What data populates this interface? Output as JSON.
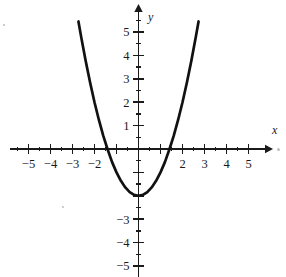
{
  "figure": {
    "kind": "cartesian-graph",
    "background_color": "#ffffff",
    "ink_color": "#1a1a1a",
    "curve_color": "#111111"
  },
  "axes": {
    "x_axis_label": "x",
    "y_axis_label": "y",
    "x_label_style": "italic",
    "y_label_style": "italic",
    "x_tick_labels": [
      "-5",
      "-4",
      "-3",
      "-2",
      "2",
      "3",
      "4",
      "5"
    ],
    "x_tick_values": [
      -5,
      -4,
      -3,
      -2,
      2,
      3,
      4,
      5
    ],
    "x_tick_hidden_values": [
      -1,
      0,
      1
    ],
    "y_tick_labels": [
      "5",
      "4",
      "3",
      "2",
      "1",
      "-3",
      "-4",
      "-5"
    ],
    "y_tick_values": [
      5,
      4,
      3,
      2,
      1,
      -3,
      -4,
      -5
    ],
    "y_tick_hidden_values": [
      -1,
      -2,
      0
    ],
    "x_major_ticks": [
      -5,
      -4,
      -3,
      -2,
      -1,
      1,
      2,
      3,
      4,
      5
    ],
    "x_minor_ticks": [
      -5.5,
      -4.5,
      -3.5,
      -2.5,
      -1.5,
      -0.5,
      0.5,
      1.5,
      2.5,
      3.5,
      4.5
    ],
    "y_major_ticks": [
      5,
      4,
      3,
      2,
      1,
      -1,
      -2,
      -3,
      -4,
      -5
    ],
    "y_minor_ticks": [
      5.5,
      4.5,
      3.5,
      2.5,
      1.5,
      0.5,
      -0.5,
      -1.5,
      -2.5,
      -3.5,
      -4.5
    ],
    "has_x_arrow": true,
    "has_y_arrow": true,
    "grid": false
  },
  "chart_data": {
    "type": "line",
    "title": "",
    "xlabel": "x",
    "ylabel": "y",
    "xlim": [
      -5.8,
      5.8
    ],
    "ylim": [
      -5.6,
      5.9
    ],
    "grid": false,
    "legend": "none",
    "series": [
      {
        "name": "parabola",
        "equation": "y = x^2 - 2",
        "vertex": [
          0,
          -2
        ],
        "x_intercepts": [
          -1.41,
          1.41
        ],
        "y_intercept": -2,
        "x": [
          -2.73,
          -2.6,
          -2.4,
          -2.2,
          -2.0,
          -1.8,
          -1.6,
          -1.41,
          -1.2,
          -1.0,
          -0.8,
          -0.6,
          -0.4,
          -0.2,
          0,
          0.2,
          0.4,
          0.6,
          0.8,
          1.0,
          1.2,
          1.41,
          1.6,
          1.8,
          2.0,
          2.2,
          2.4,
          2.6,
          2.73
        ],
        "y": [
          5.45,
          4.76,
          3.76,
          2.84,
          2.0,
          1.24,
          0.56,
          0.0,
          -0.56,
          -1.0,
          -1.36,
          -1.64,
          -1.84,
          -1.96,
          -2.0,
          -1.96,
          -1.84,
          -1.64,
          -1.36,
          -1.0,
          -0.56,
          0.0,
          0.56,
          1.24,
          2.0,
          2.84,
          3.76,
          4.76,
          5.45
        ]
      }
    ]
  }
}
